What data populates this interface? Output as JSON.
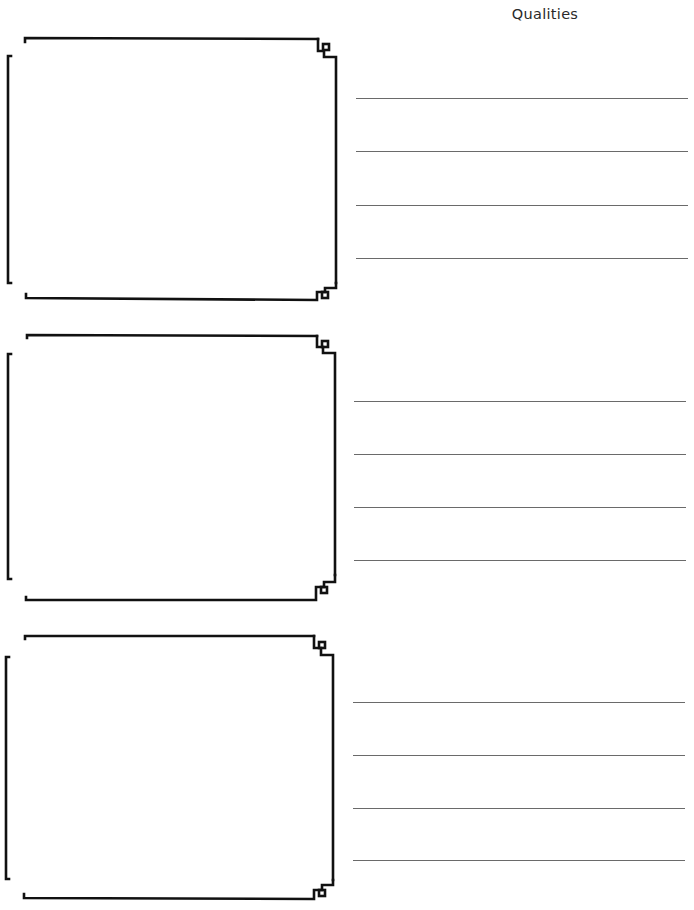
{
  "header": {
    "title": "Qualities"
  },
  "sections": [
    {
      "id": 1,
      "frame_top": 30,
      "lines": [
        {
          "y": 98,
          "x1": 356,
          "x2": 688
        },
        {
          "y": 151,
          "x1": 356,
          "x2": 688
        },
        {
          "y": 205,
          "x1": 356,
          "x2": 688
        },
        {
          "y": 258,
          "x1": 356,
          "x2": 688
        }
      ]
    },
    {
      "id": 2,
      "frame_top": 327,
      "lines": [
        {
          "y": 401,
          "x1": 354,
          "x2": 686
        },
        {
          "y": 454,
          "x1": 354,
          "x2": 686
        },
        {
          "y": 507,
          "x1": 354,
          "x2": 686
        },
        {
          "y": 560,
          "x1": 354,
          "x2": 686
        }
      ]
    },
    {
      "id": 3,
      "frame_top": 627,
      "lines": [
        {
          "y": 702,
          "x1": 353,
          "x2": 685
        },
        {
          "y": 755,
          "x1": 353,
          "x2": 685
        },
        {
          "y": 808,
          "x1": 353,
          "x2": 685
        },
        {
          "y": 860,
          "x1": 353,
          "x2": 685
        }
      ]
    }
  ],
  "colors": {
    "frame_stroke": "#111111",
    "line_stroke": "#6a6a6a",
    "title_text": "#2a2a2a"
  }
}
